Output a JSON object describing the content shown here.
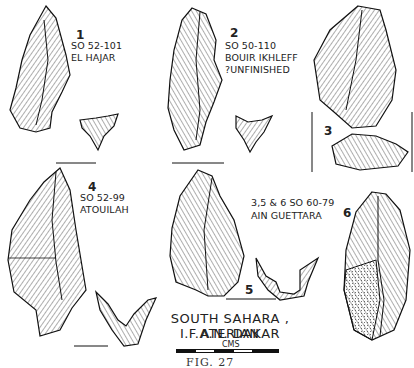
{
  "figure": {
    "caption_line1": "SOUTH SAHARA , ATERIAN",
    "caption_line2": "I.F.A.N.  DAKAR",
    "scale_label": "CMS",
    "figure_label": "FIG.  27"
  },
  "specimens": [
    {
      "number": "1",
      "catalog": "SO 52-101",
      "site": "EL HAJAR",
      "note": ""
    },
    {
      "number": "2",
      "catalog": "SO 50-110",
      "site": "BOUIR IKHLEFF",
      "note": "?UNFINISHED"
    },
    {
      "number": "3",
      "catalog": "",
      "site": "",
      "note": ""
    },
    {
      "number": "4",
      "catalog": "SO 52-99",
      "site": "ATOUILAH",
      "note": ""
    },
    {
      "number": "5",
      "catalog": "",
      "site": "",
      "note": ""
    },
    {
      "number": "6",
      "catalog": "",
      "site": "",
      "note": ""
    }
  ],
  "group_label": {
    "catalog": "3,5 & 6  SO 60-79",
    "site": "AIN GUETTARA"
  }
}
